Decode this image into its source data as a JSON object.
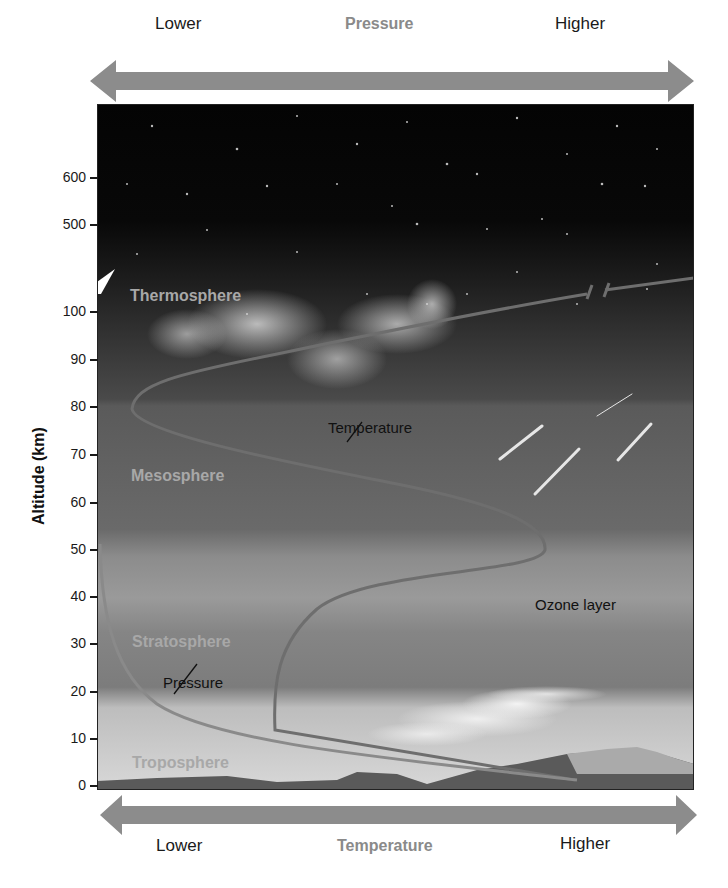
{
  "chart_data": {
    "type": "line",
    "title": "",
    "ylabel": "Altitude (km)",
    "yticks": [
      0,
      10,
      20,
      30,
      40,
      50,
      60,
      70,
      80,
      90,
      100,
      500,
      600
    ],
    "y_axis_break": "between 100 and 500 km",
    "top_axis": {
      "title": "Pressure",
      "left": "Lower",
      "right": "Higher"
    },
    "bottom_axis": {
      "title": "Temperature",
      "left": "Lower",
      "right": "Higher"
    },
    "layers": [
      {
        "name": "Troposphere",
        "range_km": [
          0,
          12
        ]
      },
      {
        "name": "Stratosphere",
        "range_km": [
          12,
          50
        ]
      },
      {
        "name": "Mesosphere",
        "range_km": [
          50,
          80
        ]
      },
      {
        "name": "Thermosphere",
        "range_km": [
          80,
          600
        ]
      }
    ],
    "series": [
      {
        "name": "Temperature",
        "points_relative_x_altitude_km": [
          [
            0.8,
            0
          ],
          [
            0.3,
            12
          ],
          [
            0.32,
            25
          ],
          [
            0.5,
            40
          ],
          [
            0.75,
            50
          ],
          [
            0.5,
            65
          ],
          [
            0.06,
            80
          ],
          [
            0.2,
            88
          ],
          [
            1.0,
            104
          ]
        ]
      },
      {
        "name": "Pressure",
        "points_relative_x_altitude_km": [
          [
            1.0,
            0
          ],
          [
            0.5,
            6
          ],
          [
            0.15,
            14
          ],
          [
            0.03,
            30
          ],
          [
            0.0,
            50
          ]
        ]
      }
    ],
    "annotations": [
      "Temperature",
      "Pressure",
      "Ozone layer"
    ],
    "grid": false
  },
  "top_arrow": {
    "left": "Lower",
    "title": "Pressure",
    "right": "Higher"
  },
  "bottom_arrow": {
    "left": "Lower",
    "title": "Temperature",
    "right": "Higher"
  },
  "y_axis": {
    "label": "Altitude (km)",
    "ticks": [
      {
        "label": "600",
        "y": 178
      },
      {
        "label": "500",
        "y": 225
      },
      {
        "label": "100",
        "y": 312
      },
      {
        "label": "90",
        "y": 360
      },
      {
        "label": "80",
        "y": 407
      },
      {
        "label": "70",
        "y": 455
      },
      {
        "label": "60",
        "y": 503
      },
      {
        "label": "50",
        "y": 550
      },
      {
        "label": "40",
        "y": 597
      },
      {
        "label": "30",
        "y": 644
      },
      {
        "label": "20",
        "y": 692
      },
      {
        "label": "10",
        "y": 739
      },
      {
        "label": "0",
        "y": 786
      }
    ]
  },
  "layers": {
    "thermosphere": "Thermosphere",
    "mesosphere": "Mesosphere",
    "stratosphere": "Stratosphere",
    "troposphere": "Troposphere"
  },
  "annotations": {
    "temperature": "Temperature",
    "pressure": "Pressure",
    "ozone": "Ozone layer"
  },
  "colors": {
    "arrow": "#8c8c8c",
    "space": "#050505",
    "curve": "#6e6e6e",
    "layer_text": "#a8a8a8"
  }
}
